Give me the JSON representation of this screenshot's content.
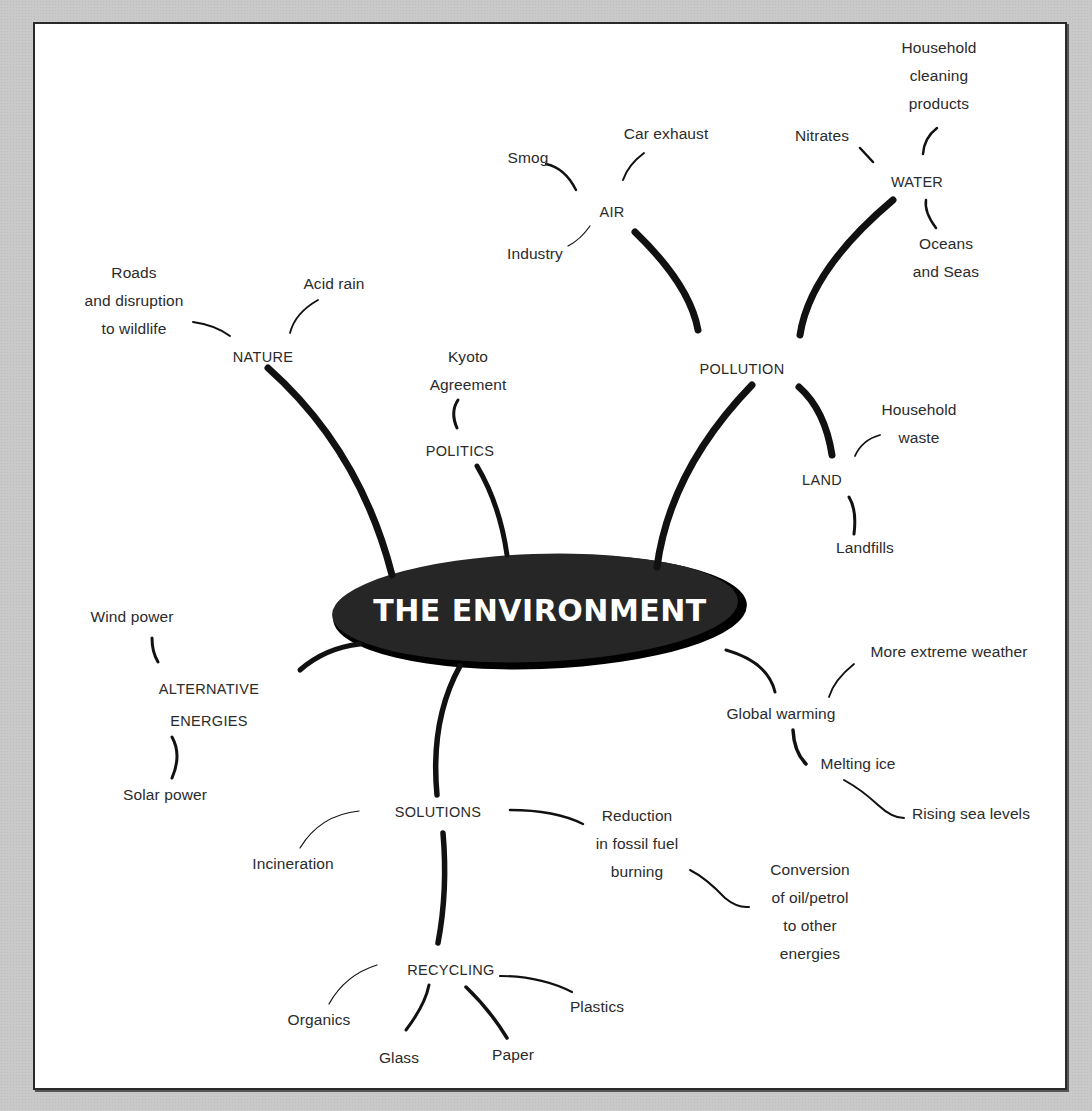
{
  "diagram": {
    "type": "mind-map",
    "central_topic": "THE ENVIRONMENT",
    "colors": {
      "background": "#c9c9c9",
      "panel": "#ffffff",
      "ellipse": "#1f1f1f",
      "text": "#2b2b2b",
      "title_text": "#ffffff"
    },
    "branches": {
      "nature": {
        "label": "NATURE",
        "children": [
          "Roads\nand disruption\nto wildlife",
          "Acid rain"
        ]
      },
      "politics": {
        "label": "POLITICS",
        "children": [
          "Kyoto\nAgreement"
        ]
      },
      "pollution": {
        "label": "POLLUTION",
        "air": {
          "label": "AIR",
          "children": [
            "Smog",
            "Car exhaust",
            "Industry"
          ]
        },
        "water": {
          "label": "WATER",
          "children": [
            "Nitrates",
            "Household\ncleaning\nproducts",
            "Oceans\nand Seas"
          ]
        },
        "land": {
          "label": "LAND",
          "children": [
            "Household\nwaste",
            "Landfills"
          ]
        }
      },
      "alternative_energies": {
        "label": "ALTERNATIVE\nENERGIES",
        "children": [
          "Wind power",
          "Solar power"
        ]
      },
      "global_warming": {
        "label": "Global warming",
        "children": [
          "More extreme weather",
          "Melting ice"
        ],
        "melting_ice_children": [
          "Rising sea levels"
        ]
      },
      "solutions": {
        "label": "SOLUTIONS",
        "children": [
          "Incineration",
          "Reduction\nin fossil fuel\nburning"
        ],
        "reduction_children": [
          "Conversion\nof oil/petrol\nto other\nenergies"
        ],
        "recycling": {
          "label": "RECYCLING",
          "children": [
            "Organics",
            "Glass",
            "Paper",
            "Plastics"
          ]
        }
      }
    }
  }
}
